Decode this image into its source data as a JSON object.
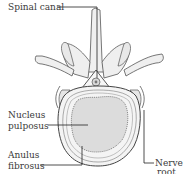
{
  "labels": {
    "spinal_canal": "Spinal canal",
    "nucleus_line1": "Nucleus",
    "nucleus_line2": "pulposus",
    "anulus_line1": "Anulus",
    "anulus_line2": "fibrosus",
    "nerve_line1": "Nerve",
    "nerve_line2": "root"
  },
  "colors": {
    "ink": "#3a3a3a",
    "bone_fill": "#f2f2f2",
    "nucleus_fill": "#d9d9d9",
    "background": "#ffffff"
  }
}
